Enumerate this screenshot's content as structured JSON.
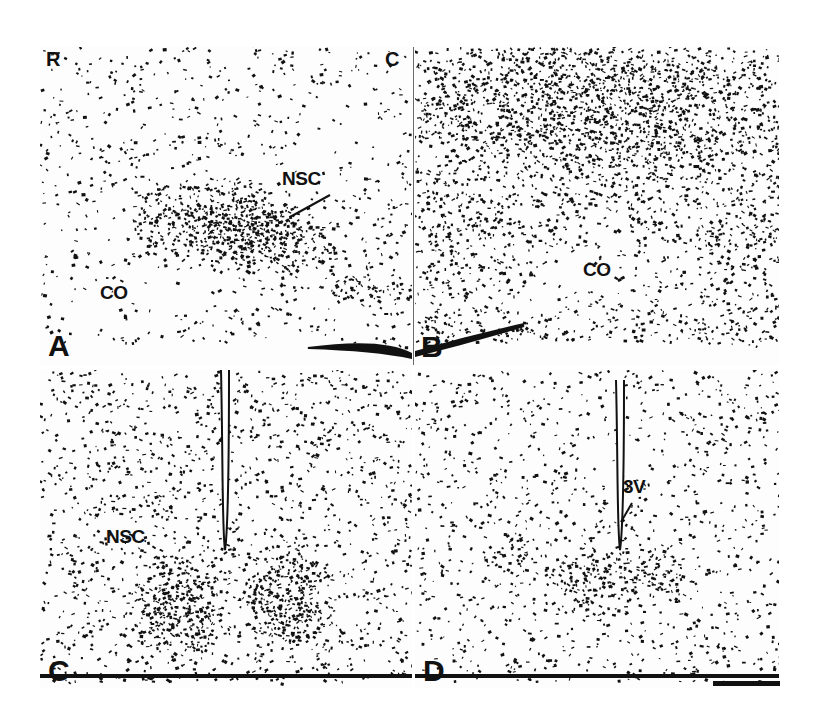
{
  "figure": {
    "panels": [
      {
        "id": "A",
        "letter": "A",
        "box": {
          "x": 40,
          "y": 47,
          "w": 372,
          "h": 318
        },
        "base_density": 0.0075,
        "clusters": [
          {
            "cx": 175,
            "cy": 170,
            "rx": 95,
            "ry": 45,
            "density": 0.06
          },
          {
            "cx": 230,
            "cy": 195,
            "rx": 80,
            "ry": 35,
            "density": 0.035
          },
          {
            "cx": 320,
            "cy": 240,
            "rx": 60,
            "ry": 15,
            "density": 0.03
          }
        ],
        "clear_zones": [
          {
            "cx": 90,
            "cy": 250,
            "rx": 100,
            "ry": 45
          },
          {
            "cx": 300,
            "cy": 90,
            "rx": 70,
            "ry": 50
          }
        ],
        "bottom_edge": "curve",
        "labels": [
          {
            "name": "orientation-rostral",
            "text": "R",
            "cls": "orient",
            "x": 6,
            "y": 2
          },
          {
            "name": "orientation-caudal",
            "text": "C",
            "cls": "orient",
            "x": 345,
            "y": 2
          },
          {
            "name": "structure-nsc",
            "text": "NSC",
            "cls": "struct",
            "x": 242,
            "y": 122
          },
          {
            "name": "structure-co",
            "text": "CO",
            "cls": "struct",
            "x": 60,
            "y": 236
          },
          {
            "name": "panel-letter-a",
            "text": "A",
            "cls": "panel-letter",
            "x": 8,
            "y": 284
          }
        ],
        "pointer": {
          "x1": 290,
          "y1": 148,
          "x2": 250,
          "y2": 170
        }
      },
      {
        "id": "B",
        "letter": "B",
        "box": {
          "x": 415,
          "y": 47,
          "w": 364,
          "h": 318
        },
        "base_density": 0.022,
        "clusters": [
          {
            "cx": 180,
            "cy": 60,
            "rx": 200,
            "ry": 80,
            "density": 0.03
          }
        ],
        "clear_zones": [
          {
            "cx": 180,
            "cy": 225,
            "rx": 150,
            "ry": 65
          }
        ],
        "bottom_edge": "curve",
        "labels": [
          {
            "name": "structure-co",
            "text": "CO",
            "cls": "struct",
            "x": 168,
            "y": 213
          },
          {
            "name": "panel-letter-b",
            "text": "B",
            "cls": "panel-letter",
            "x": 6,
            "y": 285
          }
        ]
      },
      {
        "id": "C",
        "letter": "C",
        "box": {
          "x": 40,
          "y": 370,
          "w": 372,
          "h": 318
        },
        "base_density": 0.012,
        "clusters": [
          {
            "cx": 135,
            "cy": 235,
            "rx": 55,
            "ry": 60,
            "density": 0.05
          },
          {
            "cx": 245,
            "cy": 225,
            "rx": 55,
            "ry": 55,
            "density": 0.05
          }
        ],
        "clear_zones": [],
        "bottom_edge": "flat",
        "ventricle": {
          "x": 185,
          "y_top": 0,
          "y_bottom": 180
        },
        "labels": [
          {
            "name": "structure-nsc",
            "text": "NSC",
            "cls": "struct",
            "x": 66,
            "y": 157
          },
          {
            "name": "panel-letter-c",
            "text": "C",
            "cls": "panel-letter",
            "x": 8,
            "y": 286
          }
        ]
      },
      {
        "id": "D",
        "letter": "D",
        "box": {
          "x": 415,
          "y": 370,
          "w": 364,
          "h": 318
        },
        "base_density": 0.009,
        "clusters": [
          {
            "cx": 170,
            "cy": 210,
            "rx": 50,
            "ry": 40,
            "density": 0.035
          },
          {
            "cx": 235,
            "cy": 205,
            "rx": 45,
            "ry": 35,
            "density": 0.03
          },
          {
            "cx": 100,
            "cy": 185,
            "rx": 40,
            "ry": 30,
            "density": 0.025
          }
        ],
        "clear_zones": [],
        "bottom_edge": "flat",
        "ventricle": {
          "x": 205,
          "y_top": 10,
          "y_bottom": 180
        },
        "labels": [
          {
            "name": "structure-3v",
            "text": "3V",
            "cls": "struct",
            "x": 208,
            "y": 107
          },
          {
            "name": "panel-letter-d",
            "text": "D",
            "cls": "panel-letter",
            "x": 8,
            "y": 286
          }
        ],
        "pointer": {
          "x1": 217,
          "y1": 133,
          "x2": 206,
          "y2": 152
        }
      }
    ],
    "scale_bar": {
      "x": 713,
      "y": 681,
      "w": 67,
      "h": 5
    },
    "ink_color": "#111111",
    "background_color": "#ffffff"
  }
}
